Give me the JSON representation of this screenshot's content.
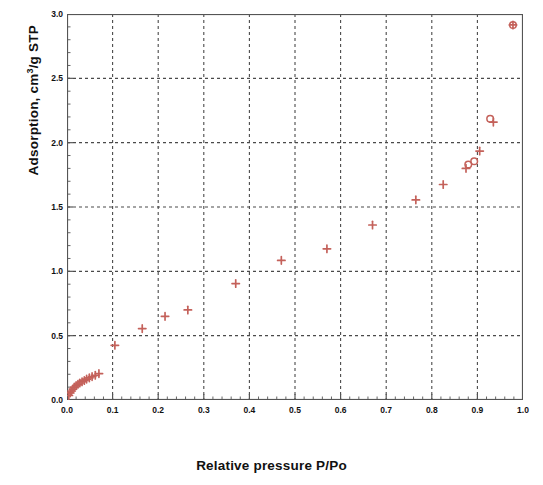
{
  "chart_data": {
    "type": "scatter",
    "title": "",
    "xlabel": "Relative pressure P/Po",
    "ylabel_text": "Adsorption, cm",
    "ylabel_sup": "3",
    "ylabel_tail": "/g STP",
    "ylabel_full": "Adsorption, cm3/g STP",
    "xlim": [
      0.0,
      1.0
    ],
    "ylim": [
      0.0,
      3.0
    ],
    "grid": true,
    "grid_style": "dashed",
    "xticks": [
      0.0,
      0.1,
      0.2,
      0.3,
      0.4,
      0.5,
      0.6,
      0.7,
      0.8,
      0.9,
      1.0
    ],
    "xticklabels": [
      "0.0",
      "0.1",
      "0.2",
      "0.3",
      "0.4",
      "0.5",
      "0.6",
      "0.7",
      "0.8",
      "0.9",
      "1.0"
    ],
    "yticks": [
      0.0,
      0.5,
      1.0,
      1.5,
      2.0,
      2.5,
      3.0
    ],
    "yticklabels": [
      "0.0",
      "0.5",
      "1.0",
      "1.5",
      "2.0",
      "2.5",
      "3.0"
    ],
    "x_minor_interval": 0.02,
    "y_minor_interval": 0.1,
    "marker_color": "#c4615a",
    "axis_color": "#555555",
    "grid_color": "#4a4a4a",
    "legend": [],
    "series": [
      {
        "name": "Adsorption",
        "marker": "plus",
        "color": "#c4615a",
        "points": [
          [
            0.004,
            0.035
          ],
          [
            0.007,
            0.055
          ],
          [
            0.01,
            0.07
          ],
          [
            0.013,
            0.085
          ],
          [
            0.016,
            0.1
          ],
          [
            0.02,
            0.112
          ],
          [
            0.024,
            0.122
          ],
          [
            0.028,
            0.132
          ],
          [
            0.033,
            0.142
          ],
          [
            0.038,
            0.152
          ],
          [
            0.043,
            0.162
          ],
          [
            0.049,
            0.172
          ],
          [
            0.055,
            0.182
          ],
          [
            0.062,
            0.192
          ],
          [
            0.07,
            0.205
          ],
          [
            0.105,
            0.425
          ],
          [
            0.165,
            0.555
          ],
          [
            0.215,
            0.65
          ],
          [
            0.265,
            0.7
          ],
          [
            0.37,
            0.905
          ],
          [
            0.47,
            1.085
          ],
          [
            0.57,
            1.175
          ],
          [
            0.67,
            1.36
          ],
          [
            0.765,
            1.555
          ],
          [
            0.825,
            1.675
          ],
          [
            0.875,
            1.8
          ],
          [
            0.905,
            1.935
          ],
          [
            0.935,
            2.16
          ],
          [
            0.978,
            2.915
          ]
        ]
      },
      {
        "name": "Desorption",
        "marker": "circle",
        "color": "#c4615a",
        "points": [
          [
            0.978,
            2.915
          ],
          [
            0.928,
            2.185
          ],
          [
            0.893,
            1.855
          ],
          [
            0.88,
            1.83
          ]
        ]
      }
    ]
  }
}
